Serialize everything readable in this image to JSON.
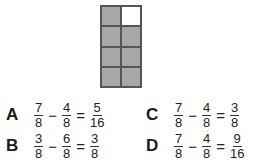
{
  "figure": {
    "grid": {
      "rows": 4,
      "cols": 2,
      "shaded_cells": 7,
      "total_cells": 8,
      "cells": [
        "shaded",
        "empty",
        "shaded",
        "shaded",
        "shaded",
        "shaded",
        "shaded",
        "shaded"
      ]
    },
    "colors": {
      "shaded": "#a8a8a8",
      "empty": "#ffffff",
      "border": "#555555"
    }
  },
  "options": [
    {
      "letter": "A",
      "a_num": "7",
      "a_den": "8",
      "op": "−",
      "b_num": "4",
      "b_den": "8",
      "eq": "=",
      "r_num": "5",
      "r_den": "16"
    },
    {
      "letter": "B",
      "a_num": "3",
      "a_den": "8",
      "op": "−",
      "b_num": "6",
      "b_den": "8",
      "eq": "=",
      "r_num": "3",
      "r_den": "8"
    },
    {
      "letter": "C",
      "a_num": "7",
      "a_den": "8",
      "op": "−",
      "b_num": "4",
      "b_den": "8",
      "eq": "=",
      "r_num": "3",
      "r_den": "8"
    },
    {
      "letter": "D",
      "a_num": "7",
      "a_den": "8",
      "op": "−",
      "b_num": "4",
      "b_den": "8",
      "eq": "=",
      "r_num": "9",
      "r_den": "16"
    }
  ]
}
